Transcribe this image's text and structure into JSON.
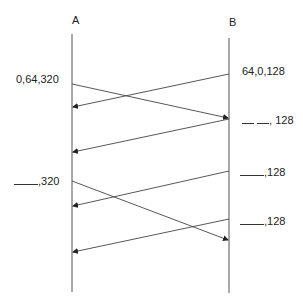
{
  "diagram": {
    "type": "sequence-diagram",
    "nodes": [
      {
        "id": "A",
        "label": "A",
        "x": 72
      },
      {
        "id": "B",
        "label": "B",
        "x": 229
      }
    ],
    "labels": {
      "a_first": "0,64,320",
      "a_second_suffix": ",320",
      "b_first": "64,0,128",
      "b_second_suffix": ", 128",
      "b_third_suffix": ",128",
      "b_fourth_suffix": ",128"
    },
    "messages": [
      {
        "from": "A",
        "to": "B",
        "y_start": 84,
        "y_end": 118
      },
      {
        "from": "B",
        "to": "A",
        "y_start": 74,
        "y_end": 107
      },
      {
        "from": "B",
        "to": "A",
        "y_start": 119,
        "y_end": 152
      },
      {
        "from": "A",
        "to": "B",
        "y_start": 181,
        "y_end": 240
      },
      {
        "from": "B",
        "to": "A",
        "y_start": 171,
        "y_end": 206
      },
      {
        "from": "B",
        "to": "A",
        "y_start": 219,
        "y_end": 252
      }
    ],
    "line_color": "#444444"
  }
}
